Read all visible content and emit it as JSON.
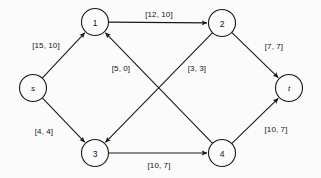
{
  "figure": {
    "kind": "flow-network-diagram",
    "width": 321,
    "height": 178,
    "background_color": "#fbfbfc",
    "stroke_color": "#1a1a1a",
    "text_color": "#111111",
    "label_format": "[capacity, flow]"
  },
  "chart_data": {
    "type": "diagram",
    "title": "",
    "xlabel": "",
    "ylabel": "",
    "grid": false,
    "legend": null,
    "node_radius": 13.5,
    "nodes": [
      {
        "id": "s",
        "label": "s",
        "x": 33,
        "y": 88,
        "style": "italic",
        "role": "source"
      },
      {
        "id": "1",
        "label": "1",
        "x": 95,
        "y": 22,
        "style": "normal",
        "role": "intermediate"
      },
      {
        "id": "2",
        "label": "2",
        "x": 222,
        "y": 23,
        "style": "normal",
        "role": "intermediate"
      },
      {
        "id": "3",
        "label": "3",
        "x": 95,
        "y": 153,
        "style": "normal",
        "role": "intermediate"
      },
      {
        "id": "4",
        "label": "4",
        "x": 222,
        "y": 153,
        "style": "normal",
        "role": "intermediate"
      },
      {
        "id": "t",
        "label": "t",
        "x": 289,
        "y": 88,
        "style": "italic",
        "role": "sink"
      }
    ],
    "edges": [
      {
        "id": "s-1",
        "from": "s",
        "to": "1",
        "capacity": 15,
        "flow": 10,
        "label": "[15, 10]",
        "label_x": 46,
        "label_y": 45
      },
      {
        "id": "s-3",
        "from": "s",
        "to": "3",
        "capacity": 4,
        "flow": 4,
        "label": "[4, 4]",
        "label_x": 44,
        "label_y": 131
      },
      {
        "id": "1-2",
        "from": "1",
        "to": "2",
        "capacity": 12,
        "flow": 10,
        "label": "[12, 10]",
        "label_x": 159,
        "label_y": 14
      },
      {
        "id": "2-t",
        "from": "2",
        "to": "t",
        "capacity": 7,
        "flow": 7,
        "label": "[7, 7]",
        "label_x": 274,
        "label_y": 46
      },
      {
        "id": "2-3",
        "from": "2",
        "to": "3",
        "capacity": 5,
        "flow": 0,
        "label": "[5, 0]",
        "label_x": 121,
        "label_y": 68
      },
      {
        "id": "4-1",
        "from": "4",
        "to": "1",
        "capacity": 3,
        "flow": 3,
        "label": "[3, 3]",
        "label_x": 197,
        "label_y": 68
      },
      {
        "id": "3-4",
        "from": "3",
        "to": "4",
        "capacity": 10,
        "flow": 7,
        "label": "[10, 7]",
        "label_x": 159,
        "label_y": 165
      },
      {
        "id": "4-t",
        "from": "4",
        "to": "t",
        "capacity": 10,
        "flow": 7,
        "label": "[10, 7]",
        "label_x": 276,
        "label_y": 129
      }
    ]
  }
}
